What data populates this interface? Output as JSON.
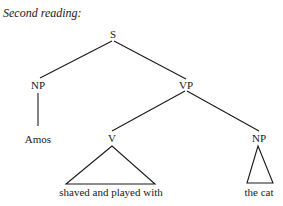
{
  "title": "Second reading:",
  "tree": {
    "nodes": {
      "s": "S",
      "np_subject": "NP",
      "vp": "VP",
      "subject_word": "Amos",
      "v": "V",
      "np_object": "NP",
      "v_leaf": "shaved and played with",
      "np_object_leaf": "the cat"
    }
  }
}
